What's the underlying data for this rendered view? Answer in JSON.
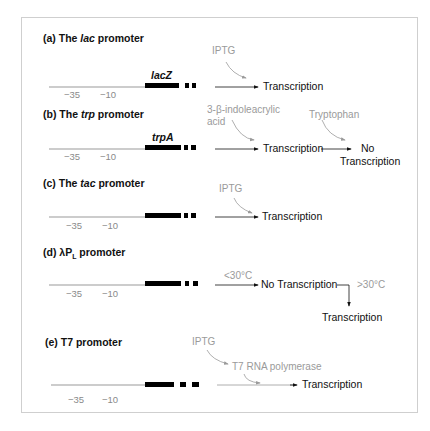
{
  "figure": {
    "panels": [
      {
        "id": "a",
        "title_prefix": "(a) The ",
        "title_italic": "lac",
        "title_suffix": " promoter",
        "gene": "lacZ",
        "ticks": [
          "−35",
          "−10"
        ],
        "inducers": [
          "IPTG"
        ],
        "outcome": "Transcription"
      },
      {
        "id": "b",
        "title_prefix": "(b) The ",
        "title_italic": "trp",
        "title_suffix": " promoter",
        "gene": "trpA",
        "ticks": [
          "−35",
          "−10"
        ],
        "inducer_line1": "3-β-indoleacrylic",
        "inducer_line2": "acid",
        "outcome": "Transcription",
        "repressor": "Tryptophan",
        "final_line1": "No",
        "final_line2": "Transcription"
      },
      {
        "id": "c",
        "title_prefix": "(c) The ",
        "title_italic": "tac",
        "title_suffix": " promoter",
        "ticks": [
          "−35",
          "−10"
        ],
        "inducers": [
          "IPTG"
        ],
        "outcome": "Transcription"
      },
      {
        "id": "d",
        "title_prefix": "(d) λP",
        "title_sub": "L",
        "title_suffix": " promoter",
        "ticks": [
          "−35",
          "−10"
        ],
        "condition_low": "<30°C",
        "outcome_low": "No Transcription",
        "condition_high": ">30°C",
        "outcome_high": "Transcription"
      },
      {
        "id": "e",
        "title": "(e) T7 promoter",
        "ticks": [
          "−35",
          "−10"
        ],
        "inducer": "IPTG",
        "intermediate": "T7 RNA polymerase",
        "outcome": "Transcription"
      }
    ]
  }
}
